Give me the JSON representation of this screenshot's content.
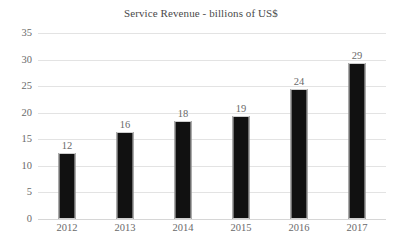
{
  "chart_data": {
    "type": "bar",
    "title": "Service Revenue - billions of US$",
    "xlabel": "",
    "ylabel": "",
    "categories": [
      "2012",
      "2013",
      "2014",
      "2015",
      "2016",
      "2017"
    ],
    "values": [
      12,
      16,
      18,
      19,
      24,
      29
    ],
    "data_labels": [
      "12",
      "16",
      "18",
      "19",
      "24",
      "29"
    ],
    "ylim": [
      0,
      35
    ],
    "ytick_step": 5,
    "ytick_labels": [
      "35",
      "30",
      "25",
      "20",
      "15",
      "10",
      "5",
      "0"
    ],
    "ytick_values": [
      35,
      30,
      25,
      20,
      15,
      10,
      5,
      0
    ],
    "grid": true,
    "grid_orientation": "horizontal",
    "legend": false,
    "legend_position": "none",
    "series": [
      {
        "name": "Service Revenue",
        "values": [
          12,
          16,
          18,
          19,
          24,
          29
        ]
      }
    ],
    "colors": {
      "bar": "#111111",
      "bar_outline": "#cfcfcf",
      "gridline": "#e3e3e3",
      "baseline": "#d6d6d6",
      "text": "#6a6a6a",
      "title": "#4a4a4a",
      "background": "#ffffff"
    }
  }
}
